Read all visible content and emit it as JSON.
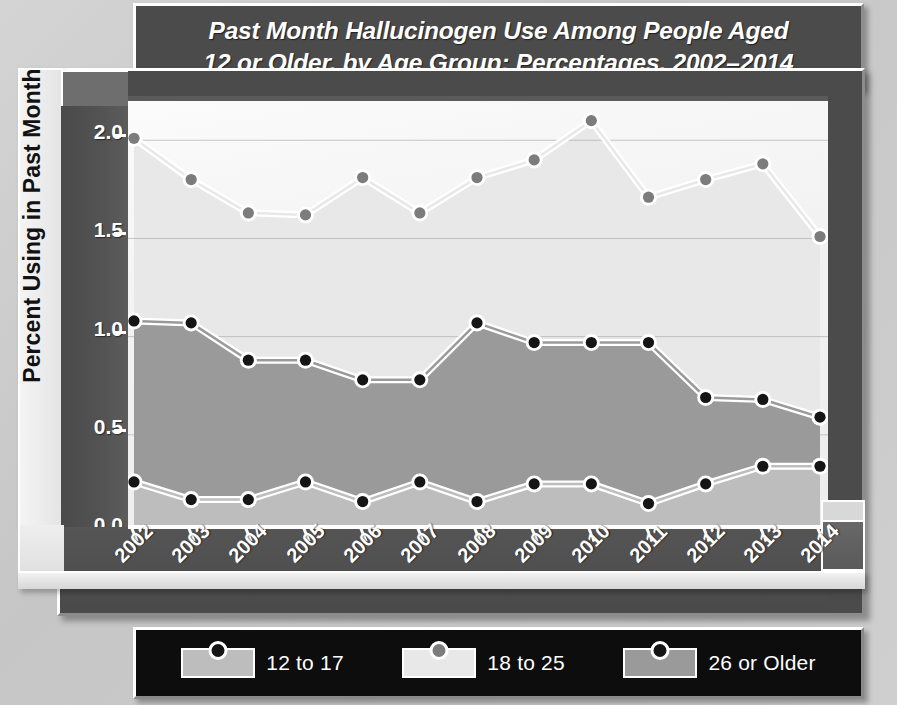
{
  "title": "Past Month Hallucinogen Use Among People Aged\n12 or Older, by Age Group: Percentages, 2002–2014",
  "axis": {
    "ylabel": "Percent Using in Past Month",
    "yticks": [
      "0.0",
      "0.5",
      "1.0",
      "1.5",
      "2.0"
    ]
  },
  "legend": {
    "items": [
      {
        "label": "12 to 17",
        "fill": "#bdbdbd",
        "marker": "#151515"
      },
      {
        "label": "18 to 25",
        "fill": "#e8e8e8",
        "marker": "#7c7c7c"
      },
      {
        "label": "26 or Older",
        "fill": "#9a9a9a",
        "marker": "#151515"
      }
    ]
  },
  "chart_data": {
    "type": "line",
    "title": "Past Month Hallucinogen Use Among People Aged 12 or Older, by Age Group: Percentages, 2002–2014",
    "xlabel": "",
    "ylabel": "Percent Using in Past Month",
    "ylim": [
      0.0,
      2.2
    ],
    "yticks": [
      0.0,
      0.5,
      1.0,
      1.5,
      2.0
    ],
    "grid": true,
    "legend_position": "bottom",
    "categories": [
      "2002",
      "2003",
      "2004",
      "2005",
      "2006",
      "2007",
      "2008",
      "2009",
      "2010",
      "2011",
      "2012",
      "2013",
      "2014"
    ],
    "series": [
      {
        "name": "12 to 17",
        "color": "#151515",
        "fill": "#bdbdbd",
        "values": [
          0.26,
          0.17,
          0.17,
          0.26,
          0.16,
          0.26,
          0.16,
          0.25,
          0.25,
          0.15,
          0.25,
          0.34,
          0.34
        ]
      },
      {
        "name": "18 to 25",
        "color": "#7c7c7c",
        "fill": "#e8e8e8",
        "values": [
          2.01,
          1.8,
          1.63,
          1.62,
          1.81,
          1.63,
          1.81,
          1.9,
          2.1,
          1.71,
          1.8,
          1.88,
          1.51
        ]
      },
      {
        "name": "26 or Older",
        "color": "#151515",
        "fill": "#9a9a9a",
        "values": [
          1.08,
          1.07,
          0.88,
          0.88,
          0.78,
          0.78,
          1.07,
          0.97,
          0.97,
          0.97,
          0.69,
          0.68,
          0.59
        ]
      }
    ]
  }
}
